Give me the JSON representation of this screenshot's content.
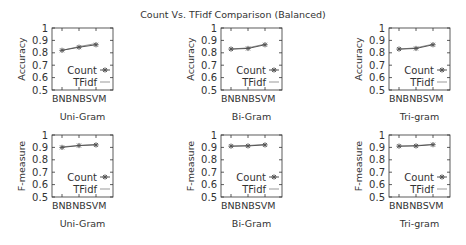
{
  "chart_data": {
    "type": "line",
    "title": "Count Vs. TFidf Comparison (Balanced)",
    "layout": {
      "rows": 2,
      "cols": 3,
      "legend_position": "lower right inside each subplot",
      "grid": false
    },
    "colors": {
      "count": "#555555",
      "tfidf": "#999999",
      "axis": "#333333"
    },
    "subplots": [
      {
        "row": 0,
        "col": 0,
        "xlabel": "Uni-Gram",
        "ylabel": "Accuracy",
        "ylim": [
          0.5,
          1
        ],
        "yticks": [
          "0.5",
          "0.6",
          "0.7",
          "0.8",
          "0.9",
          "1"
        ],
        "categories": [
          "BNB",
          "NB",
          "SVM"
        ],
        "series": [
          {
            "name": "Count",
            "values": [
              0.82,
              0.845,
              0.865
            ]
          },
          {
            "name": "TFidf",
            "values": [
              0.82,
              0.85,
              0.875
            ]
          }
        ]
      },
      {
        "row": 0,
        "col": 1,
        "xlabel": "Bi-Gram",
        "ylabel": "Accuracy",
        "ylim": [
          0.5,
          1
        ],
        "yticks": [
          "0.5",
          "0.6",
          "0.7",
          "0.8",
          "0.9",
          "1"
        ],
        "categories": [
          "BNB",
          "NB",
          "SVM"
        ],
        "series": [
          {
            "name": "Count",
            "values": [
              0.83,
              0.835,
              0.865
            ]
          },
          {
            "name": "TFidf",
            "values": [
              0.83,
              0.84,
              0.87
            ]
          }
        ]
      },
      {
        "row": 0,
        "col": 2,
        "xlabel": "Tri-gram",
        "ylabel": "Accuracy",
        "ylim": [
          0.5,
          1
        ],
        "yticks": [
          "0.5",
          "0.6",
          "0.7",
          "0.8",
          "0.9",
          "1"
        ],
        "categories": [
          "BNB",
          "NB",
          "SVM"
        ],
        "series": [
          {
            "name": "Count",
            "values": [
              0.83,
              0.835,
              0.865
            ]
          },
          {
            "name": "TFidf",
            "values": [
              0.83,
              0.84,
              0.87
            ]
          }
        ]
      },
      {
        "row": 1,
        "col": 0,
        "xlabel": "Uni-Gram",
        "ylabel": "F-measure",
        "ylim": [
          0.5,
          1
        ],
        "yticks": [
          "0.5",
          "0.6",
          "0.7",
          "0.8",
          "0.9",
          "1"
        ],
        "categories": [
          "BNB",
          "NB",
          "SVM"
        ],
        "series": [
          {
            "name": "Count",
            "values": [
              0.9,
              0.915,
              0.92
            ]
          },
          {
            "name": "TFidf",
            "values": [
              0.905,
              0.915,
              0.925
            ]
          }
        ]
      },
      {
        "row": 1,
        "col": 1,
        "xlabel": "Bi-Gram",
        "ylabel": "F-measure",
        "ylim": [
          0.5,
          1
        ],
        "yticks": [
          "0.5",
          "0.6",
          "0.7",
          "0.8",
          "0.9",
          "1"
        ],
        "categories": [
          "BNB",
          "NB",
          "SVM"
        ],
        "series": [
          {
            "name": "Count",
            "values": [
              0.91,
              0.912,
              0.92
            ]
          },
          {
            "name": "TFidf",
            "values": [
              0.91,
              0.915,
              0.925
            ]
          }
        ]
      },
      {
        "row": 1,
        "col": 2,
        "xlabel": "Tri-gram",
        "ylabel": "F-measure",
        "ylim": [
          0.5,
          1
        ],
        "yticks": [
          "0.5",
          "0.6",
          "0.7",
          "0.8",
          "0.9",
          "1"
        ],
        "categories": [
          "BNB",
          "NB",
          "SVM"
        ],
        "series": [
          {
            "name": "Count",
            "values": [
              0.91,
              0.912,
              0.922
            ]
          },
          {
            "name": "TFidf",
            "values": [
              0.91,
              0.915,
              0.925
            ]
          }
        ]
      }
    ],
    "legend": [
      "Count",
      "TFidf"
    ]
  }
}
